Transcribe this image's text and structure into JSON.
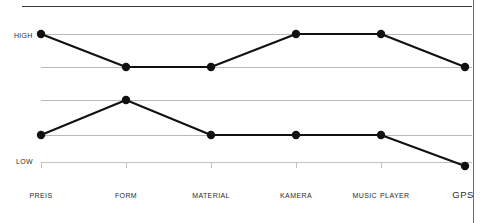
{
  "chart_data": {
    "type": "line",
    "title": "",
    "xlabel": "",
    "ylabel": "",
    "categories": [
      "Preis",
      "Form",
      "Material",
      "Kamera",
      "Music Player",
      "GPS"
    ],
    "y_tick_labels": [
      "High",
      "Low"
    ],
    "ylim": [
      0,
      5
    ],
    "grid": true,
    "legend": "none",
    "gridline_levels": [
      4,
      3,
      2,
      1,
      0
    ],
    "series": [
      {
        "name": "upper",
        "values": [
          4,
          3,
          3,
          4,
          4,
          3
        ],
        "marker": "circle",
        "color": "#111111"
      },
      {
        "name": "lower",
        "values": [
          1,
          2,
          1,
          1,
          1,
          0
        ],
        "marker": "circle",
        "color": "#111111"
      }
    ]
  },
  "axis": {
    "high_label": "High",
    "low_label": "Low"
  },
  "categories": [
    {
      "label": "Preis",
      "acronym": false
    },
    {
      "label": "Form",
      "acronym": false
    },
    {
      "label": "Material",
      "acronym": false
    },
    {
      "label": "Kamera",
      "acronym": false
    },
    {
      "label": "Music Player",
      "acronym": false
    },
    {
      "label": "GPS",
      "acronym": true
    }
  ],
  "colors": {
    "line": "#111111",
    "marker": "#111111",
    "gridline": "#b9b9b9",
    "top_rule": "#3a3a3a",
    "border": "#6f6f6f",
    "text": "#2b2b2b"
  }
}
